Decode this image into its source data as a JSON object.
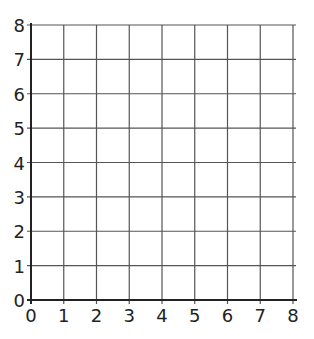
{
  "chart_data": {
    "type": "grid",
    "title": "",
    "xlabel": "",
    "ylabel": "",
    "xlim": [
      0,
      8
    ],
    "ylim": [
      0,
      8
    ],
    "x_ticks": [
      "0",
      "1",
      "2",
      "3",
      "4",
      "5",
      "6",
      "7",
      "8"
    ],
    "y_ticks": [
      "0",
      "1",
      "2",
      "3",
      "4",
      "5",
      "6",
      "7",
      "8"
    ],
    "grid": true,
    "series": []
  },
  "colors": {
    "grid_line": "#555555",
    "axis_line": "#222222",
    "background": "#ffffff"
  }
}
